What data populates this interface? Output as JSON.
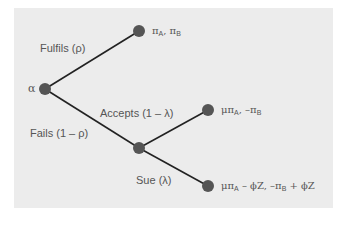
{
  "diagram": {
    "type": "game-tree",
    "colors": {
      "background": "#ececec",
      "edge": "#222222",
      "node": "#555555",
      "text": "#555555"
    },
    "nodes": [
      {
        "id": "root",
        "label": "α",
        "x": 45,
        "y": 89
      },
      {
        "id": "fulfil",
        "x": 139,
        "y": 31
      },
      {
        "id": "fail",
        "x": 139,
        "y": 148
      },
      {
        "id": "accept",
        "x": 208,
        "y": 110
      },
      {
        "id": "sue",
        "x": 208,
        "y": 186
      }
    ],
    "edges": [
      {
        "from": "root",
        "to": "fulfil",
        "label": "Fulfils (ρ)"
      },
      {
        "from": "root",
        "to": "fail",
        "label": "Fails (1 – ρ)"
      },
      {
        "from": "fail",
        "to": "accept",
        "label": "Accepts (1 – λ)"
      },
      {
        "from": "fail",
        "to": "sue",
        "label": "Sue (λ)"
      }
    ],
    "labels": {
      "root": "α",
      "fulfils": "Fulfils (ρ)",
      "fails": "Fails (1 – ρ)",
      "accepts": "Accepts (1 – λ)",
      "sue": "Sue (λ)"
    },
    "payoffs": {
      "fulfil": {
        "a_pre": "π",
        "a_sub": "A",
        "sep": ", ",
        "b_pre": "π",
        "b_sub": "B",
        "tail": ""
      },
      "accept": {
        "a_pre": "μπ",
        "a_sub": "A",
        "sep": ", –",
        "b_pre": "π",
        "b_sub": "B",
        "tail": ""
      },
      "sue": {
        "a_pre": "μπ",
        "a_sub": "A",
        "mid": " – ϕZ, –",
        "b_pre": "π",
        "b_sub": "B",
        "tail": " + ϕZ"
      }
    }
  }
}
